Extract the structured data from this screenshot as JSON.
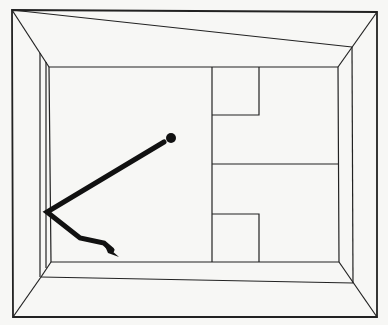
{
  "diagram": {
    "title": "",
    "colors": {
      "background": "#f7f7f5",
      "line": "#222222",
      "path": "#111111"
    },
    "room": {
      "outer": [
        [
          12,
          10
        ],
        [
          377,
          12
        ],
        [
          377,
          317
        ],
        [
          13,
          317
        ]
      ],
      "inner": [
        [
          49,
          67
        ],
        [
          338,
          67
        ],
        [
          339,
          262
        ],
        [
          51,
          262
        ]
      ],
      "top_slant": [
        [
          12,
          10
        ],
        [
          352,
          47
        ]
      ],
      "bottom_slant": [
        [
          41,
          277
        ],
        [
          353,
          283
        ]
      ],
      "left_inner_post": [
        [
          40,
          53
        ],
        [
          40,
          277
        ]
      ],
      "right_inner_post": [
        [
          352,
          47
        ],
        [
          353,
          283
        ]
      ]
    },
    "back_wall": {
      "partition_x": 212,
      "horizontal_divider_y": 164,
      "upper_box": {
        "x1": 212,
        "y1": 67,
        "x2": 259,
        "y2": 115
      },
      "lower_box": {
        "x1": 212,
        "y1": 214,
        "x2": 259,
        "y2": 262
      }
    },
    "trajectory": {
      "ball": {
        "cx": 171,
        "cy": 138,
        "r": 5
      },
      "points": [
        [
          164,
          142
        ],
        [
          47,
          212
        ],
        [
          80,
          238
        ],
        [
          104,
          243
        ],
        [
          114,
          251
        ]
      ],
      "arrow_tip": [
        119,
        257
      ]
    }
  }
}
